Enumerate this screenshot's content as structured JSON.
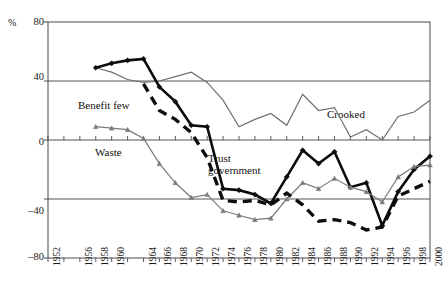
{
  "chart_data": {
    "type": "line",
    "title": "",
    "xlabel": "",
    "ylabel": "%",
    "ylim": [
      -80,
      80
    ],
    "yticks": [
      80,
      40,
      0,
      -40,
      -80
    ],
    "ytick_labels": [
      "80",
      "40",
      "0",
      "–40",
      "–80"
    ],
    "grid": "horizontal-gridlines-at-40-0-minus40",
    "legend_position": "inline-annotations",
    "x": [
      1952,
      1954,
      1956,
      1958,
      1960,
      1962,
      1964,
      1966,
      1968,
      1970,
      1972,
      1974,
      1976,
      1978,
      1980,
      1982,
      1984,
      1986,
      1988,
      1990,
      1992,
      1994,
      1996,
      1998,
      2000
    ],
    "xtick_labels": [
      "1952",
      "1956",
      "1958",
      "1960",
      "1964",
      "1966",
      "1968",
      "1970",
      "1972",
      "1974",
      "1976",
      "1978",
      "1980",
      "1982",
      "1984",
      "1986",
      "1988",
      "1990",
      "1992",
      "1994",
      "1996",
      "1998",
      "2000"
    ],
    "series": [
      {
        "name": "Crooked",
        "style": "solid-gray-thin",
        "color": "#6e6e6e",
        "marker": "none",
        "label": "Crooked",
        "points": [
          {
            "x": 1958,
            "y": 49
          },
          {
            "x": 1960,
            "y": 46
          },
          {
            "x": 1962,
            "y": 41
          },
          {
            "x": 1964,
            "y": 39
          },
          {
            "x": 1966,
            "y": 40
          },
          {
            "x": 1968,
            "y": 43
          },
          {
            "x": 1970,
            "y": 46
          },
          {
            "x": 1972,
            "y": 39
          },
          {
            "x": 1974,
            "y": 27
          },
          {
            "x": 1976,
            "y": 9
          },
          {
            "x": 1978,
            "y": 14
          },
          {
            "x": 1980,
            "y": 18
          },
          {
            "x": 1982,
            "y": 10
          },
          {
            "x": 1984,
            "y": 31
          },
          {
            "x": 1986,
            "y": 20
          },
          {
            "x": 1988,
            "y": 22
          },
          {
            "x": 1990,
            "y": 2
          },
          {
            "x": 1992,
            "y": 7
          },
          {
            "x": 1994,
            "y": 0
          },
          {
            "x": 1996,
            "y": 16
          },
          {
            "x": 1998,
            "y": 19
          },
          {
            "x": 2000,
            "y": 27
          }
        ]
      },
      {
        "name": "Trust government",
        "style": "solid-black-thick-diamond",
        "color": "#0d0d0d",
        "marker": "diamond",
        "label": "Trust\ngovernment",
        "points": [
          {
            "x": 1958,
            "y": 49
          },
          {
            "x": 1960,
            "y": 52
          },
          {
            "x": 1962,
            "y": 54
          },
          {
            "x": 1964,
            "y": 55
          },
          {
            "x": 1966,
            "y": 36
          },
          {
            "x": 1968,
            "y": 26
          },
          {
            "x": 1970,
            "y": 10
          },
          {
            "x": 1972,
            "y": 9
          },
          {
            "x": 1974,
            "y": -33
          },
          {
            "x": 1976,
            "y": -34
          },
          {
            "x": 1978,
            "y": -37
          },
          {
            "x": 1980,
            "y": -43
          },
          {
            "x": 1982,
            "y": -25
          },
          {
            "x": 1984,
            "y": -7
          },
          {
            "x": 1986,
            "y": -16
          },
          {
            "x": 1988,
            "y": -8
          },
          {
            "x": 1990,
            "y": -32
          },
          {
            "x": 1992,
            "y": -29
          },
          {
            "x": 1994,
            "y": -58
          },
          {
            "x": 1996,
            "y": -35
          },
          {
            "x": 1998,
            "y": -20
          },
          {
            "x": 2000,
            "y": -11
          }
        ]
      },
      {
        "name": "Waste",
        "style": "solid-gray-thin-triangle",
        "color": "#7a7a7a",
        "marker": "triangle",
        "label": "Waste",
        "points": [
          {
            "x": 1958,
            "y": 9
          },
          {
            "x": 1960,
            "y": 8
          },
          {
            "x": 1962,
            "y": 7
          },
          {
            "x": 1964,
            "y": 1
          },
          {
            "x": 1966,
            "y": -16
          },
          {
            "x": 1968,
            "y": -29
          },
          {
            "x": 1970,
            "y": -39
          },
          {
            "x": 1972,
            "y": -37
          },
          {
            "x": 1974,
            "y": -48
          },
          {
            "x": 1976,
            "y": -51
          },
          {
            "x": 1978,
            "y": -54
          },
          {
            "x": 1980,
            "y": -53
          },
          {
            "x": 1982,
            "y": -40
          },
          {
            "x": 1984,
            "y": -29
          },
          {
            "x": 1986,
            "y": -33
          },
          {
            "x": 1988,
            "y": -26
          },
          {
            "x": 1990,
            "y": -32
          },
          {
            "x": 1992,
            "y": -35
          },
          {
            "x": 1994,
            "y": -42
          },
          {
            "x": 1996,
            "y": -25
          },
          {
            "x": 1998,
            "y": -18
          },
          {
            "x": 2000,
            "y": -17
          }
        ]
      },
      {
        "name": "Benefit few",
        "style": "dashed-black-thick",
        "color": "#0d0d0d",
        "marker": "none",
        "label": "Benefit few",
        "points": [
          {
            "x": 1964,
            "y": 38
          },
          {
            "x": 1966,
            "y": 20
          },
          {
            "x": 1968,
            "y": 14
          },
          {
            "x": 1970,
            "y": 5
          },
          {
            "x": 1972,
            "y": -12
          },
          {
            "x": 1974,
            "y": -41
          },
          {
            "x": 1976,
            "y": -42
          },
          {
            "x": 1978,
            "y": -41
          },
          {
            "x": 1980,
            "y": -44
          },
          {
            "x": 1982,
            "y": -36
          },
          {
            "x": 1984,
            "y": -44
          },
          {
            "x": 1986,
            "y": -55
          },
          {
            "x": 1988,
            "y": -54
          },
          {
            "x": 1990,
            "y": -56
          },
          {
            "x": 1992,
            "y": -61
          },
          {
            "x": 1994,
            "y": -59
          },
          {
            "x": 1996,
            "y": -38
          },
          {
            "x": 1998,
            "y": -33
          },
          {
            "x": 2000,
            "y": -28
          }
        ]
      }
    ],
    "annotations": [
      {
        "id": "benefit-few",
        "text": "Benefit few",
        "x_px": 78,
        "y_px": 99
      },
      {
        "id": "waste",
        "text": "Waste",
        "x_px": 95,
        "y_px": 146
      },
      {
        "id": "trust-government",
        "text": "Trust\ngovernment",
        "x_px": 208,
        "y_px": 152
      },
      {
        "id": "crooked",
        "text": "Crooked",
        "x_px": 327,
        "y_px": 108
      }
    ]
  },
  "axes": {
    "y_unit": "%",
    "y_tick_labels": [
      "80",
      "40",
      "0",
      "–40",
      "–80"
    ],
    "x_tick_labels": [
      "1952",
      "1956",
      "1958",
      "1960",
      "1964",
      "1966",
      "1968",
      "1970",
      "1972",
      "1974",
      "1976",
      "1978",
      "1980",
      "1982",
      "1984",
      "1986",
      "1988",
      "1990",
      "1992",
      "1994",
      "1996",
      "1998",
      "2000"
    ]
  },
  "top_fragment": {
    "text": ""
  }
}
